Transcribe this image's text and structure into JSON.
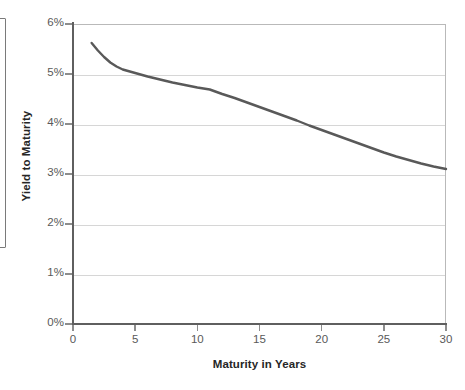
{
  "chart_data": {
    "type": "line",
    "title": "",
    "subtitle": "",
    "xlabel": "Maturity in Years",
    "ylabel": "Yield to Maturity",
    "xlim": [
      0,
      30
    ],
    "ylim": [
      0,
      6
    ],
    "grid": true,
    "legend": false,
    "legend_position": "none",
    "x_ticks": [
      0,
      5,
      10,
      15,
      20,
      25,
      30
    ],
    "x_tick_labels": [
      "0",
      "5",
      "10",
      "15",
      "20",
      "25",
      "30"
    ],
    "y_ticks": [
      0,
      1,
      2,
      3,
      4,
      5,
      6
    ],
    "y_tick_labels": [
      "0%",
      "1%",
      "2%",
      "3%",
      "4%",
      "5%",
      "6%"
    ],
    "y_unit": "percent",
    "series": [
      {
        "name": "Yield curve",
        "color": "#595959",
        "line_width": 2.4,
        "x": [
          1.5,
          2,
          2.5,
          3,
          3.5,
          4,
          5,
          6,
          7,
          8,
          9,
          10,
          11,
          12,
          13,
          14,
          15,
          16,
          17,
          18,
          19,
          20,
          21,
          22,
          23,
          24,
          25,
          26,
          27,
          28,
          29,
          30
        ],
        "y": [
          5.62,
          5.47,
          5.34,
          5.23,
          5.15,
          5.09,
          5.02,
          4.95,
          4.89,
          4.83,
          4.78,
          4.73,
          4.69,
          4.6,
          4.52,
          4.43,
          4.34,
          4.25,
          4.16,
          4.07,
          3.97,
          3.88,
          3.79,
          3.7,
          3.61,
          3.52,
          3.43,
          3.35,
          3.28,
          3.21,
          3.15,
          3.1
        ]
      }
    ],
    "annotations": []
  },
  "axes": {
    "x_title": "Maturity in Years",
    "y_title": "Yield to Maturity"
  },
  "colors": {
    "series_line": "#595959",
    "gridline": "#d6d6d6",
    "axis_line": "#5f5f5f",
    "tick_text": "#595959",
    "axis_title_text": "#262626",
    "plot_border": "#b9b9b9",
    "background": "#ffffff",
    "edge_frame_border": "#7a7a7a"
  }
}
